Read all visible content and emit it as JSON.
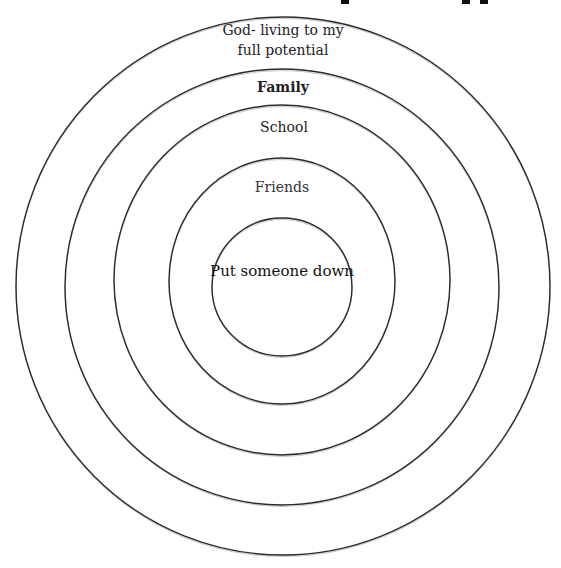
{
  "diagram": {
    "type": "concentric-circles",
    "heading_fragment_visible": true,
    "rings": [
      {
        "level": 1,
        "label": "God- living to my",
        "label_line2": "full potential",
        "cx": 283,
        "cy": 286,
        "rx": 267,
        "ry": 269
      },
      {
        "level": 2,
        "label": "Family",
        "cx": 282,
        "cy": 287,
        "rx": 217,
        "ry": 218
      },
      {
        "level": 3,
        "label": "School",
        "cx": 282,
        "cy": 280,
        "rx": 168,
        "ry": 175
      },
      {
        "level": 4,
        "label": "Friends",
        "cx": 282,
        "cy": 281,
        "rx": 113,
        "ry": 123
      },
      {
        "level": 5,
        "label": "Put someone down",
        "cx": 282,
        "cy": 287,
        "rx": 70,
        "ry": 69
      }
    ],
    "stroke_color": "#2a2a2a",
    "background": "#ffffff"
  }
}
